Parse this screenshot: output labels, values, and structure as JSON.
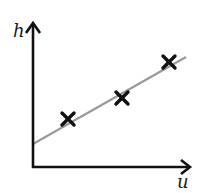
{
  "diagram": {
    "type": "scatter-with-fit-line",
    "axes": {
      "x_label": "u",
      "y_label": "h"
    },
    "points": [
      {
        "x": 68,
        "y": 119
      },
      {
        "x": 122,
        "y": 98
      },
      {
        "x": 169,
        "y": 62
      }
    ],
    "fit_line": {
      "x1": 33,
      "y1": 144,
      "x2": 186,
      "y2": 57
    },
    "colors": {
      "axis": "#111111",
      "fit_line": "#9a9a9a",
      "marker": "#111111"
    }
  }
}
